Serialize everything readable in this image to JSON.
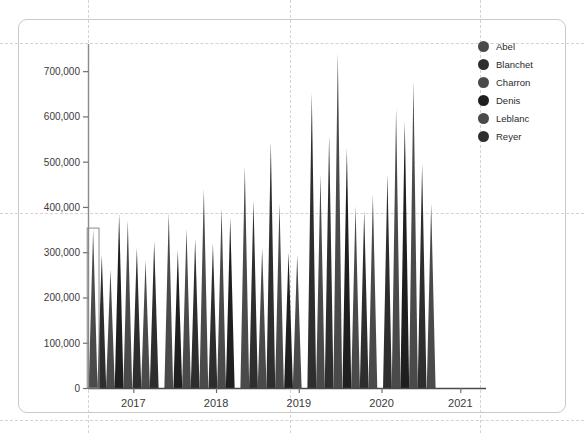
{
  "card": {
    "name": "chart-card"
  },
  "legend": {
    "position": "top-right",
    "items": [
      {
        "label": "Abel",
        "color": "#4a4a4a"
      },
      {
        "label": "Blanchet",
        "color": "#2e2e2e"
      },
      {
        "label": "Charron",
        "color": "#4a4a4a"
      },
      {
        "label": "Denis",
        "color": "#1f1f1f"
      },
      {
        "label": "Leblanc",
        "color": "#4a4a4a"
      },
      {
        "label": "Reyer",
        "color": "#2e2e2e"
      }
    ]
  },
  "axes": {
    "y_ticks": [
      "0",
      "100,000",
      "200,000",
      "300,000",
      "400,000",
      "500,000",
      "600,000",
      "700,000"
    ],
    "x_ticks": [
      "2017",
      "2018",
      "2019",
      "2020",
      "2021"
    ]
  },
  "selection": {
    "visible": true,
    "label": "selected-spike-handle"
  },
  "chart_data": {
    "type": "bar",
    "title": "",
    "subtitle": "",
    "xlabel": "",
    "ylabel": "",
    "grid": true,
    "legend_position": "right",
    "ylim": [
      0,
      760000
    ],
    "ytick_values": [
      0,
      100000,
      200000,
      300000,
      400000,
      500000,
      600000,
      700000
    ],
    "ytick_labels": [
      "0",
      "100,000",
      "200,000",
      "300,000",
      "400,000",
      "500,000",
      "600,000",
      "700,000"
    ],
    "xtick_labels": [
      "2017",
      "2018",
      "2019",
      "2020",
      "2021"
    ],
    "xtick_positions": [
      0.115,
      0.325,
      0.535,
      0.745,
      0.945
    ],
    "series_names": [
      "Abel",
      "Blanchet",
      "Charron",
      "Denis",
      "Leblanc",
      "Reyer"
    ],
    "series_colors": [
      "#4a4a4a",
      "#2e2e2e",
      "#4a4a4a",
      "#1f1f1f",
      "#4a4a4a",
      "#2e2e2e"
    ],
    "note": "Each datum is drawn as a narrow triangular spike (wide base at y=0, point at the value). Values are read off the y-axis; series index cycles through the six names.",
    "points": [
      {
        "x": 0.013,
        "value": 350000,
        "series": 0,
        "selected": true
      },
      {
        "x": 0.035,
        "value": 295000,
        "series": 1
      },
      {
        "x": 0.057,
        "value": 262000,
        "series": 2
      },
      {
        "x": 0.079,
        "value": 385000,
        "series": 3
      },
      {
        "x": 0.101,
        "value": 370000,
        "series": 4
      },
      {
        "x": 0.124,
        "value": 310000,
        "series": 5
      },
      {
        "x": 0.146,
        "value": 282000,
        "series": 0
      },
      {
        "x": 0.168,
        "value": 325000,
        "series": 1
      },
      {
        "x": 0.205,
        "value": 388000,
        "series": 2
      },
      {
        "x": 0.228,
        "value": 305000,
        "series": 3
      },
      {
        "x": 0.25,
        "value": 352000,
        "series": 4
      },
      {
        "x": 0.272,
        "value": 330000,
        "series": 5
      },
      {
        "x": 0.294,
        "value": 440000,
        "series": 0
      },
      {
        "x": 0.317,
        "value": 320000,
        "series": 1
      },
      {
        "x": 0.339,
        "value": 398000,
        "series": 2
      },
      {
        "x": 0.361,
        "value": 376000,
        "series": 3
      },
      {
        "x": 0.398,
        "value": 490000,
        "series": 4
      },
      {
        "x": 0.42,
        "value": 415000,
        "series": 5
      },
      {
        "x": 0.442,
        "value": 310000,
        "series": 0
      },
      {
        "x": 0.464,
        "value": 545000,
        "series": 1
      },
      {
        "x": 0.486,
        "value": 408000,
        "series": 2
      },
      {
        "x": 0.509,
        "value": 300000,
        "series": 3
      },
      {
        "x": 0.531,
        "value": 295000,
        "series": 4
      },
      {
        "x": 0.568,
        "value": 652000,
        "series": 5
      },
      {
        "x": 0.59,
        "value": 470000,
        "series": 0
      },
      {
        "x": 0.612,
        "value": 558000,
        "series": 1
      },
      {
        "x": 0.634,
        "value": 742000,
        "series": 2
      },
      {
        "x": 0.657,
        "value": 530000,
        "series": 3
      },
      {
        "x": 0.679,
        "value": 402000,
        "series": 4
      },
      {
        "x": 0.701,
        "value": 392000,
        "series": 5
      },
      {
        "x": 0.723,
        "value": 428000,
        "series": 0
      },
      {
        "x": 0.76,
        "value": 472000,
        "series": 1
      },
      {
        "x": 0.782,
        "value": 618000,
        "series": 2
      },
      {
        "x": 0.804,
        "value": 590000,
        "series": 3
      },
      {
        "x": 0.826,
        "value": 678000,
        "series": 4
      },
      {
        "x": 0.848,
        "value": 495000,
        "series": 5
      },
      {
        "x": 0.871,
        "value": 408000,
        "series": 0
      }
    ]
  }
}
